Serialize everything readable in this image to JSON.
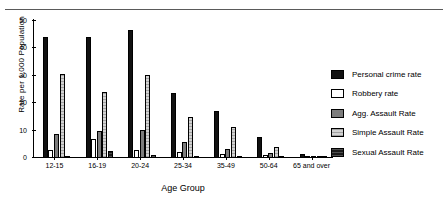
{
  "chart_data": {
    "type": "bar",
    "title": "",
    "xlabel": "Age Group",
    "ylabel": "Rate per 1,000 Population",
    "ylim": [
      0,
      50
    ],
    "yticks": [
      0,
      10,
      20,
      30,
      40,
      50
    ],
    "grid": false,
    "legend_position": "right",
    "categories": [
      "12-15",
      "16-19",
      "20-24",
      "25-34",
      "35-49",
      "50-64",
      "65 and over"
    ],
    "series": [
      {
        "name": "Personal crime rate",
        "values": [
          44.0,
          44.3,
          46.9,
          23.7,
          17.1,
          7.6,
          1.5
        ]
      },
      {
        "name": "Robbery rate",
        "values": [
          2.8,
          6.9,
          3.0,
          2.1,
          1.6,
          1.1,
          0.6
        ]
      },
      {
        "name": "Agg. Assault Rate",
        "values": [
          8.6,
          9.7,
          10.1,
          5.8,
          3.4,
          1.7,
          0.5
        ]
      },
      {
        "name": "Simple Assault Rate",
        "values": [
          30.5,
          24.0,
          30.2,
          14.9,
          11.5,
          4.2,
          0.8
        ]
      },
      {
        "name": "Sexual Assault Rate",
        "values": [
          0.9,
          2.6,
          1.2,
          0.7,
          0.4,
          0.2,
          0.1
        ]
      }
    ],
    "series_colors": [
      "#111111",
      "#ffffff",
      "#7c7c7c",
      "#d2d2d2",
      "#1a1a1a"
    ]
  },
  "legend": {
    "items": [
      {
        "label": "Personal crime rate"
      },
      {
        "label": "Robbery rate"
      },
      {
        "label": "Agg. Assault Rate"
      },
      {
        "label": "Simple Assault Rate"
      },
      {
        "label": "Sexual Assault Rate"
      }
    ]
  }
}
